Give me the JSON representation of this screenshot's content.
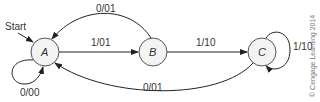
{
  "diagram": {
    "type": "finite-state-machine",
    "start_label": "Start",
    "states": [
      {
        "id": "A",
        "label": "A",
        "cx": 45,
        "cy": 52
      },
      {
        "id": "B",
        "label": "B",
        "cx": 153,
        "cy": 52
      },
      {
        "id": "C",
        "label": "C",
        "cx": 262,
        "cy": 52
      }
    ],
    "transitions": [
      {
        "from": "A",
        "to": "A",
        "label": "0/00"
      },
      {
        "from": "A",
        "to": "B",
        "label": "1/01"
      },
      {
        "from": "B",
        "to": "A",
        "label": "0/01"
      },
      {
        "from": "B",
        "to": "C",
        "label": "1/10"
      },
      {
        "from": "C",
        "to": "C",
        "label": "1/10"
      },
      {
        "from": "C",
        "to": "A",
        "label": "0/01"
      }
    ],
    "copyright": "© Cengage Learning 2014"
  }
}
